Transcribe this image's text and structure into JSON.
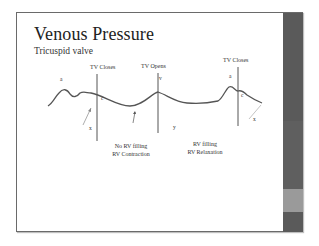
{
  "slide": {
    "title": "Venous Pressure",
    "subtitle": "Tricuspid valve"
  },
  "diagram": {
    "events": [
      {
        "label": "TV Closes",
        "position": "first"
      },
      {
        "label": "TV Opens",
        "position": "middle"
      },
      {
        "label": "TV Closes",
        "position": "last"
      }
    ],
    "wave_labels": {
      "a_first": "a",
      "c_first": "c",
      "x_first": "x",
      "v": "v",
      "y": "y",
      "a_last": "a",
      "c_last": "c",
      "x_last": "x"
    },
    "phases": [
      {
        "line1": "No RV filling",
        "line2": "RV Contraction"
      },
      {
        "line1": "RV filling",
        "line2": "RV Relaxation"
      }
    ]
  },
  "theme": {
    "side_bar_dark": "#575757",
    "side_bar_mid": "#5f5f5f",
    "side_bar_light": "#9a9a9a",
    "line_color": "#555555"
  }
}
